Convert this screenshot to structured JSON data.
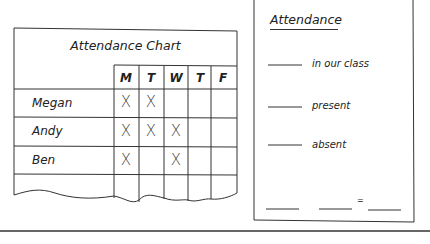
{
  "chart": {
    "title": "Attendance Chart",
    "days": [
      "M",
      "T",
      "W",
      "T",
      "F"
    ],
    "rows": [
      {
        "name": "Megan",
        "marks": [
          "X",
          "X",
          "",
          "",
          ""
        ]
      },
      {
        "name": "Andy",
        "marks": [
          "X",
          "X",
          "X",
          "",
          ""
        ]
      },
      {
        "name": "Ben",
        "marks": [
          "X",
          "",
          "X",
          "",
          ""
        ]
      }
    ]
  },
  "worksheet": {
    "title": "Attendance",
    "lines": [
      {
        "label": "in our class"
      },
      {
        "label": "present"
      },
      {
        "label": "absent"
      }
    ],
    "equation_symbol": "="
  }
}
